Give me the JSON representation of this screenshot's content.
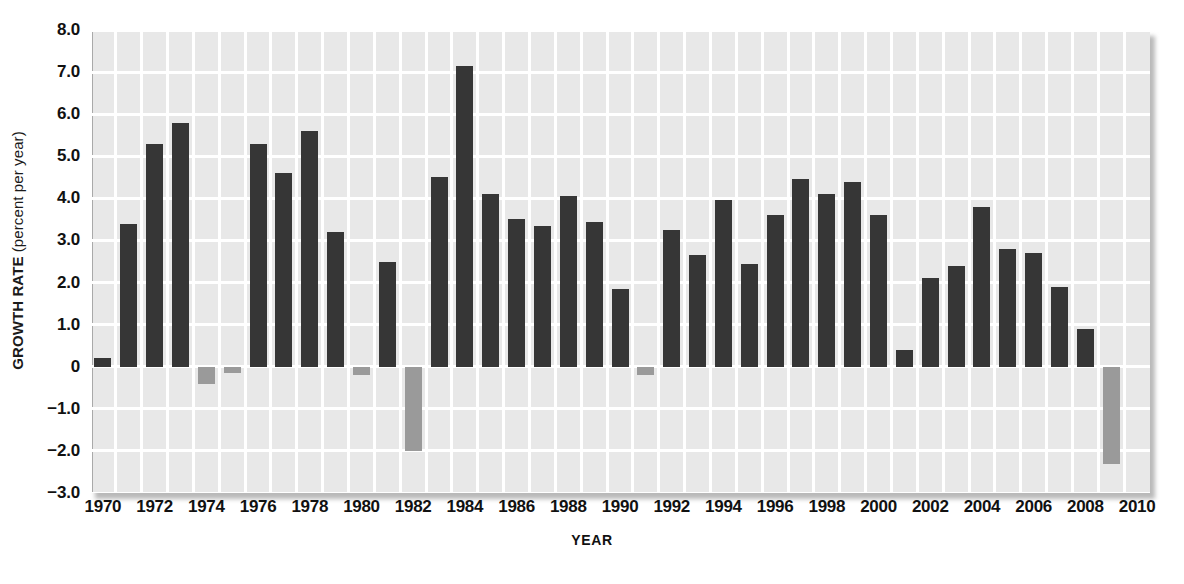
{
  "chart_data": {
    "type": "bar",
    "title": "",
    "xlabel": "YEAR",
    "ylabel": "GROWTH RATE (percent per year)",
    "ylabel_strong": "GROWTH RATE",
    "ylabel_light": " (percent per year)",
    "ylim": [
      -3.0,
      8.0
    ],
    "xlim": [
      1969.5,
      2010.5
    ],
    "grid": true,
    "legend": "none",
    "ytick_labels": [
      "8.0",
      "7.0",
      "6.0",
      "5.0",
      "4.0",
      "3.0",
      "2.0",
      "1.0",
      "0",
      "−1.0",
      "−2.0",
      "−3.0"
    ],
    "ytick_values": [
      8.0,
      7.0,
      6.0,
      5.0,
      4.0,
      3.0,
      2.0,
      1.0,
      0.0,
      -1.0,
      -2.0,
      -3.0
    ],
    "xtick_labels": [
      "1970",
      "1972",
      "1974",
      "1976",
      "1978",
      "1980",
      "1982",
      "1984",
      "1986",
      "1988",
      "1990",
      "1992",
      "1994",
      "1996",
      "1998",
      "2000",
      "2002",
      "2004",
      "2006",
      "2008",
      "2010"
    ],
    "xtick_values": [
      1970,
      1972,
      1974,
      1976,
      1978,
      1980,
      1982,
      1984,
      1986,
      1988,
      1990,
      1992,
      1994,
      1996,
      1998,
      2000,
      2002,
      2004,
      2006,
      2008,
      2010
    ],
    "colors": {
      "positive_bar": "#363636",
      "negative_bar": "#9a9a9a",
      "plot_background": "#e8e8e8",
      "gridline": "#ffffff",
      "text": "#111111"
    },
    "categories": [
      1970,
      1971,
      1972,
      1973,
      1974,
      1975,
      1976,
      1977,
      1978,
      1979,
      1980,
      1981,
      1982,
      1983,
      1984,
      1985,
      1986,
      1987,
      1988,
      1989,
      1990,
      1991,
      1992,
      1993,
      1994,
      1995,
      1996,
      1997,
      1998,
      1999,
      2000,
      2001,
      2002,
      2003,
      2004,
      2005,
      2006,
      2007,
      2008,
      2009
    ],
    "values": [
      0.2,
      3.4,
      5.3,
      5.8,
      -0.4,
      -0.15,
      5.3,
      4.6,
      5.6,
      3.2,
      -0.2,
      2.5,
      -2.0,
      4.5,
      7.15,
      4.1,
      3.5,
      3.35,
      4.05,
      3.45,
      1.85,
      -0.2,
      3.25,
      2.65,
      3.95,
      2.45,
      3.6,
      4.45,
      4.1,
      4.4,
      3.6,
      0.4,
      2.1,
      2.4,
      3.8,
      2.8,
      2.7,
      1.9,
      0.9,
      -2.3
    ]
  }
}
